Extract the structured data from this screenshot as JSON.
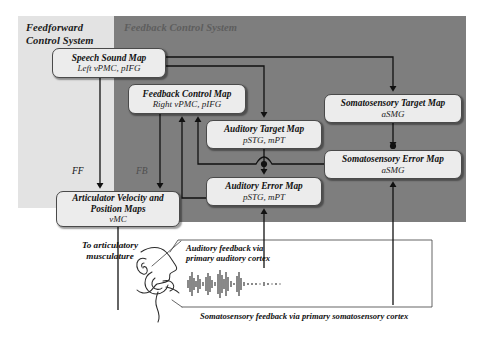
{
  "figure": {
    "title_ff": "Feedforward\nControl System",
    "title_fb": "Feedback Control System",
    "colors": {
      "feedforward_panel": "#e3e3e3",
      "feedback_panel": "#7e7e7e",
      "node_fill": "#ececec",
      "node_border": "#4a4a4a",
      "wire": "#111111"
    }
  },
  "panels": {
    "feedforward": {
      "label_line1": "Feedforward",
      "label_line2": "Control System"
    },
    "feedback": {
      "label": "Feedback Control System"
    }
  },
  "nodes": {
    "speech_sound_map": {
      "title": "Speech Sound Map",
      "region": "Left vPMC, pIFG"
    },
    "feedback_control_map": {
      "title": "Feedback Control Map",
      "region": "Right vPMC, pIFG"
    },
    "auditory_target_map": {
      "title": "Auditory Target Map",
      "region": "pSTG, mPT"
    },
    "auditory_error_map": {
      "title": "Auditory Error Map",
      "region": "pSTG, mPT"
    },
    "somatosensory_target_map": {
      "title": "Somatosensory Target Map",
      "region": "aSMG"
    },
    "somatosensory_error_map": {
      "title": "Somatosensory Error Map",
      "region": "aSMG"
    },
    "articulator_maps": {
      "title_line1": "Articulator Velocity and",
      "title_line2": "Position Maps",
      "region": "vMC"
    }
  },
  "edge_labels": {
    "feedforward_abbrev": "FF",
    "feedback_abbrev": "FB"
  },
  "annotations": {
    "to_articulatory": "To articulatory\nmusculature",
    "to_articulatory_line1": "To articulatory",
    "to_articulatory_line2": "musculature",
    "auditory_feedback_line1": "Auditory feedback via",
    "auditory_feedback_line2": "primary auditory cortex",
    "somatosensory_feedback": "Somatosensory feedback via primary somatosensory cortex"
  },
  "illustration": {
    "head_profile": "head-profile-vocal-tract",
    "waveform": "speech-waveform"
  }
}
